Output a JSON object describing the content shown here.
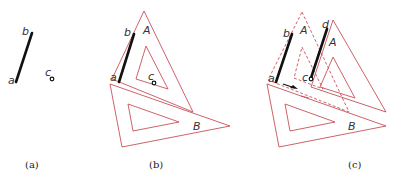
{
  "figure": {
    "panels": [
      {
        "id": "a",
        "caption": "(a)",
        "labels": {
          "a": "a",
          "b": "b",
          "c": "c"
        }
      },
      {
        "id": "b",
        "caption": "(b)",
        "labels": {
          "a": "a",
          "b": "b",
          "c": "c",
          "A": "A",
          "B": "B"
        }
      },
      {
        "id": "c",
        "caption": "(c)",
        "labels": {
          "a": "a",
          "b": "b",
          "c": "c",
          "d": "d",
          "A1": "A",
          "A2": "A",
          "B": "B"
        }
      }
    ],
    "colors": {
      "triangle_outline": "#c8505a",
      "segment": "#111111"
    }
  }
}
